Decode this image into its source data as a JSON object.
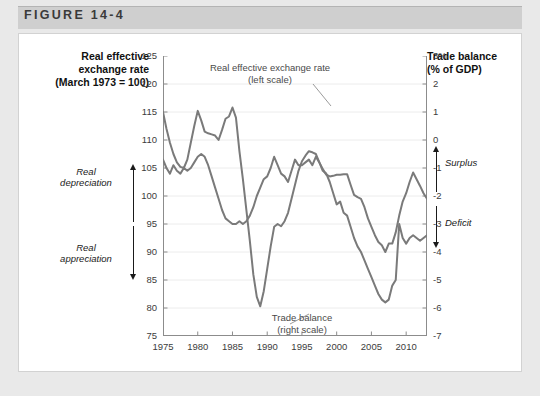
{
  "figure": {
    "number_label": "FIGURE 14-4"
  },
  "left_axis": {
    "title_line1": "Real effective",
    "title_line2": "exchange rate",
    "title_line3": "(March 1973 = 100)",
    "ticks": [
      "125",
      "120",
      "115",
      "110",
      "105",
      "100",
      "95",
      "90",
      "85",
      "80",
      "75"
    ],
    "annotation_up": "Real\ndepreciation",
    "annotation_up_line1": "Real",
    "annotation_up_line2": "depreciation",
    "annotation_down_line1": "Real",
    "annotation_down_line2": "appreciation"
  },
  "right_axis": {
    "title_line1": "Trade balance",
    "title_line2": "(% of GDP)",
    "ticks": [
      "3%",
      "2",
      "1",
      "0",
      "-1",
      "-2",
      "-3",
      "-4",
      "-5",
      "-6",
      "-7"
    ],
    "annotation_up": "Surplus",
    "annotation_down": "Deficit"
  },
  "callouts": {
    "exchange_line1": "Real effective exchange rate",
    "exchange_line2": "(left scale)",
    "trade_line1": "Trade balance",
    "trade_line2": "(right scale)"
  },
  "colors": {
    "series": "#7a7a7a",
    "grid": "#ececec",
    "axis": "#8c8c8c",
    "panel_background": "#ffffff",
    "figure_background": "#e9e9e9",
    "title_bar": "#cfcfcf",
    "text": "#3c3c3c"
  },
  "chart_data": {
    "type": "line",
    "title": "FIGURE 14-4",
    "xlabel": "",
    "ylabel": "Real effective exchange rate (March 1973 = 100)",
    "y2label": "Trade balance (% of GDP)",
    "xlim": [
      1975,
      2013
    ],
    "ylim": [
      75,
      125
    ],
    "y2lim": [
      -7,
      3
    ],
    "grid": true,
    "legend_position": "in-plot-callouts",
    "xticks": [
      "1975",
      "1980",
      "1985",
      "1990",
      "1995",
      "2000",
      "2005",
      "2010"
    ],
    "xtick_values": [
      1975,
      1980,
      1985,
      1990,
      1995,
      2000,
      2005,
      2010
    ],
    "yticks_left": [
      125,
      120,
      115,
      110,
      105,
      100,
      95,
      90,
      85,
      80,
      75
    ],
    "yticks_right": [
      3,
      2,
      1,
      0,
      -1,
      -2,
      -3,
      -4,
      -5,
      -6,
      -7
    ],
    "x": [
      1975,
      1975.5,
      1976,
      1976.5,
      1977,
      1977.5,
      1978,
      1978.5,
      1979,
      1979.5,
      1980,
      1980.5,
      1981,
      1981.5,
      1982,
      1982.5,
      1983,
      1983.5,
      1984,
      1984.5,
      1985,
      1985.5,
      1986,
      1986.5,
      1987,
      1987.5,
      1988,
      1988.5,
      1989,
      1989.5,
      1990,
      1990.5,
      1991,
      1991.5,
      1992,
      1992.5,
      1993,
      1993.5,
      1994,
      1994.5,
      1995,
      1995.5,
      1996,
      1996.5,
      1997,
      1997.5,
      1998,
      1998.5,
      1999,
      1999.5,
      2000,
      2000.5,
      2001,
      2001.5,
      2002,
      2002.5,
      2003,
      2003.5,
      2004,
      2004.5,
      2005,
      2005.5,
      2006,
      2006.5,
      2007,
      2007.5,
      2008,
      2008.5,
      2009,
      2009.5,
      2010,
      2010.5,
      2011,
      2011.5,
      2012,
      2012.5,
      2013
    ],
    "series": [
      {
        "name": "Real effective exchange rate (left scale)",
        "axis": "left",
        "units": "index, March 1973 = 100",
        "values": [
          115.0,
          112.0,
          109.5,
          107.5,
          106.0,
          105.2,
          105.0,
          106.5,
          109.5,
          112.5,
          115.2,
          113.5,
          111.5,
          111.2,
          111.0,
          110.8,
          110.0,
          111.8,
          113.8,
          114.2,
          115.8,
          114.0,
          108.0,
          103.0,
          97.5,
          92.0,
          86.0,
          82.0,
          80.3,
          83.0,
          87.0,
          91.0,
          94.5,
          95.0,
          94.6,
          95.5,
          97.0,
          99.5,
          102.0,
          104.5,
          106.2,
          107.2,
          108.0,
          107.8,
          107.5,
          106.0,
          104.8,
          103.8,
          103.5,
          103.6,
          103.8,
          103.8,
          103.9,
          103.9,
          102.0,
          100.2,
          99.8,
          99.5,
          98.0,
          96.0,
          94.5,
          93.0,
          91.8,
          91.2,
          90.0,
          91.5,
          91.5,
          93.5,
          96.5,
          99.0,
          100.5,
          102.5,
          104.2,
          103.0,
          101.8,
          100.5,
          99.5
        ]
      },
      {
        "name": "Trade balance (right scale)",
        "axis": "right",
        "units": "% of GDP",
        "values": [
          -0.7,
          -1.0,
          -1.2,
          -0.9,
          -1.1,
          -1.2,
          -1.0,
          -1.1,
          -1.0,
          -0.8,
          -0.6,
          -0.5,
          -0.6,
          -0.9,
          -1.3,
          -1.7,
          -2.1,
          -2.5,
          -2.8,
          -2.9,
          -3.0,
          -3.0,
          -2.9,
          -3.0,
          -2.9,
          -2.7,
          -2.4,
          -2.0,
          -1.7,
          -1.4,
          -1.3,
          -1.0,
          -0.6,
          -0.9,
          -1.2,
          -1.3,
          -1.5,
          -1.1,
          -0.7,
          -0.9,
          -0.9,
          -0.8,
          -0.7,
          -0.9,
          -0.6,
          -0.8,
          -1.1,
          -1.2,
          -1.5,
          -1.9,
          -2.3,
          -2.2,
          -2.6,
          -2.7,
          -3.1,
          -3.5,
          -3.8,
          -4.0,
          -4.3,
          -4.6,
          -4.9,
          -5.2,
          -5.5,
          -5.7,
          -5.8,
          -5.7,
          -5.2,
          -5.0,
          -3.0,
          -3.5,
          -3.7,
          -3.5,
          -3.4,
          -3.5,
          -3.6,
          -3.5,
          -3.4
        ]
      }
    ]
  }
}
